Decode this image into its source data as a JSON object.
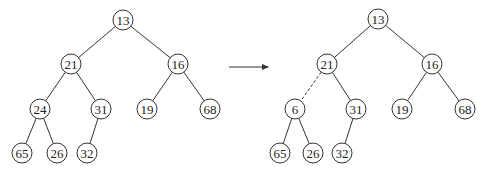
{
  "diagram": {
    "type": "binary-heap-tree-transformation",
    "left_tree": {
      "nodes": [
        {
          "id": "l13",
          "label": "13",
          "x": 123,
          "y": 20
        },
        {
          "id": "l21",
          "label": "21",
          "x": 71,
          "y": 64
        },
        {
          "id": "l16",
          "label": "16",
          "x": 178,
          "y": 64
        },
        {
          "id": "l24",
          "label": "24",
          "x": 40,
          "y": 109
        },
        {
          "id": "l31",
          "label": "31",
          "x": 101,
          "y": 109
        },
        {
          "id": "l19",
          "label": "19",
          "x": 147,
          "y": 109
        },
        {
          "id": "l68",
          "label": "68",
          "x": 210,
          "y": 109
        },
        {
          "id": "l65",
          "label": "65",
          "x": 22,
          "y": 153
        },
        {
          "id": "l26",
          "label": "26",
          "x": 57,
          "y": 153
        },
        {
          "id": "l32",
          "label": "32",
          "x": 87,
          "y": 153
        }
      ],
      "edges": [
        {
          "from": "l13",
          "to": "l21",
          "style": "solid"
        },
        {
          "from": "l13",
          "to": "l16",
          "style": "solid"
        },
        {
          "from": "l21",
          "to": "l24",
          "style": "solid"
        },
        {
          "from": "l21",
          "to": "l31",
          "style": "solid"
        },
        {
          "from": "l16",
          "to": "l19",
          "style": "solid"
        },
        {
          "from": "l16",
          "to": "l68",
          "style": "solid"
        },
        {
          "from": "l24",
          "to": "l65",
          "style": "solid"
        },
        {
          "from": "l24",
          "to": "l26",
          "style": "solid"
        },
        {
          "from": "l31",
          "to": "l32",
          "style": "solid"
        }
      ]
    },
    "arrow": {
      "x1": 229,
      "y1": 67,
      "x2": 268,
      "y2": 67
    },
    "right_tree": {
      "nodes": [
        {
          "id": "r13",
          "label": "13",
          "x": 378,
          "y": 19
        },
        {
          "id": "r21",
          "label": "21",
          "x": 327,
          "y": 64
        },
        {
          "id": "r16",
          "label": "16",
          "x": 432,
          "y": 64
        },
        {
          "id": "r6",
          "label": "6",
          "x": 295,
          "y": 109
        },
        {
          "id": "r31",
          "label": "31",
          "x": 356,
          "y": 109
        },
        {
          "id": "r19",
          "label": "19",
          "x": 402,
          "y": 109
        },
        {
          "id": "r68",
          "label": "68",
          "x": 465,
          "y": 109
        },
        {
          "id": "r65",
          "label": "65",
          "x": 280,
          "y": 153
        },
        {
          "id": "r26",
          "label": "26",
          "x": 313,
          "y": 153
        },
        {
          "id": "r32",
          "label": "32",
          "x": 342,
          "y": 153
        }
      ],
      "edges": [
        {
          "from": "r13",
          "to": "r21",
          "style": "solid"
        },
        {
          "from": "r13",
          "to": "r16",
          "style": "solid"
        },
        {
          "from": "r21",
          "to": "r6",
          "style": "dashed"
        },
        {
          "from": "r21",
          "to": "r31",
          "style": "solid"
        },
        {
          "from": "r16",
          "to": "r19",
          "style": "solid"
        },
        {
          "from": "r16",
          "to": "r68",
          "style": "solid"
        },
        {
          "from": "r6",
          "to": "r65",
          "style": "solid"
        },
        {
          "from": "r6",
          "to": "r26",
          "style": "solid"
        },
        {
          "from": "r31",
          "to": "r32",
          "style": "solid"
        }
      ]
    },
    "node_radius": 10
  }
}
